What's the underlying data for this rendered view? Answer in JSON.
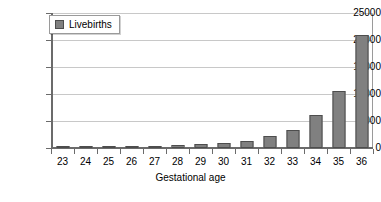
{
  "chart_data": {
    "type": "bar",
    "title": "",
    "xlabel": "Gestational age",
    "ylabel": "",
    "categories": [
      "23",
      "24",
      "25",
      "26",
      "27",
      "28",
      "29",
      "30",
      "31",
      "32",
      "33",
      "34",
      "35",
      "36"
    ],
    "values": [
      200,
      250,
      300,
      320,
      350,
      500,
      700,
      850,
      1300,
      2200,
      3400,
      6200,
      10500,
      21000
    ],
    "series": [
      {
        "name": "Livebirths",
        "values": [
          200,
          250,
          300,
          320,
          350,
          500,
          700,
          850,
          1300,
          2200,
          3400,
          6200,
          10500,
          21000
        ]
      }
    ],
    "ylim": [
      0,
      25000
    ],
    "ytick_labels": [
      "0",
      "5000",
      "10000",
      "15000",
      "20000",
      "25000"
    ],
    "ytick_values": [
      0,
      5000,
      10000,
      15000,
      20000,
      25000
    ],
    "grid": true,
    "legend": {
      "position": "top-left",
      "entries": [
        {
          "label": "Livebirths",
          "color": "#808080"
        }
      ]
    },
    "colors": {
      "bar_fill": "#808080",
      "bar_border": "#4d4d4d",
      "gridline": "#c8c8c8",
      "axis": "#6b6b6b",
      "background": "#ffffff",
      "text": "#000000"
    }
  }
}
